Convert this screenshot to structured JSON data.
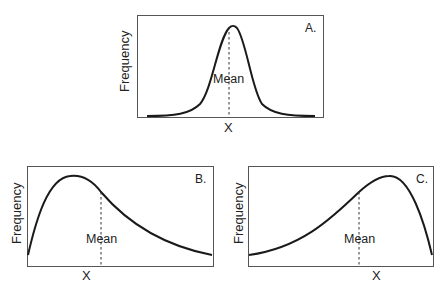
{
  "panels": [
    {
      "id": "A",
      "label": "A.",
      "ylabel": "Frequency",
      "xlabel": "X",
      "mean_label": "Mean",
      "shape": "normal (symmetric)",
      "mean_position": "center at peak"
    },
    {
      "id": "B",
      "label": "B.",
      "ylabel": "Frequency",
      "xlabel": "X",
      "mean_label": "Mean",
      "shape": "positively skewed (right tail)",
      "mean_position": "right of peak"
    },
    {
      "id": "C",
      "label": "C.",
      "ylabel": "Frequency",
      "xlabel": "X",
      "mean_label": "Mean",
      "shape": "negatively skewed (left tail)",
      "mean_position": "left of peak"
    }
  ],
  "colors": {
    "curve": "#1a1a1a",
    "frame": "#555555",
    "mean_line": "#333333"
  }
}
